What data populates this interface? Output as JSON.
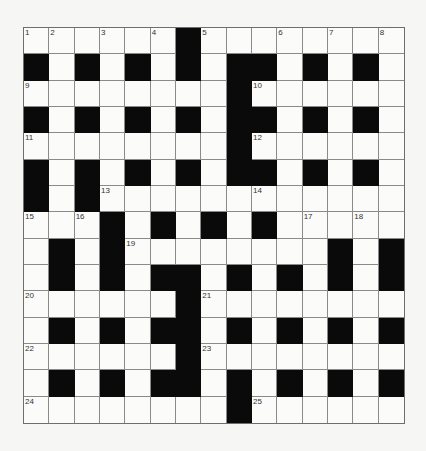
{
  "puzzle": {
    "rows": 15,
    "cols": 15,
    "colors": {
      "block": "#0a0a0a",
      "cell": "#fbfbfa",
      "gridline": "#8a8a8a",
      "background": "#f6f6f4"
    },
    "layout": [
      "......#........",
      "#.#.#.#.##.#.#.",
      "........#......",
      "#.#.#.#.##.#.#.",
      "........#......",
      "#.#.#.#.##.#.#.",
      "#.#............",
      "...#.#.#.#.....",
      ".#.#........#.#",
      ".#.#.##.#.#.#.#",
      "......#........",
      ".#.#.##.#.#.#.#",
      "......#........",
      ".#.#.##.#.#.#.#",
      "........#......"
    ],
    "numbers": [
      {
        "row": 0,
        "col": 0,
        "n": "1"
      },
      {
        "row": 0,
        "col": 1,
        "n": "2"
      },
      {
        "row": 0,
        "col": 3,
        "n": "3"
      },
      {
        "row": 0,
        "col": 5,
        "n": "4"
      },
      {
        "row": 0,
        "col": 7,
        "n": "5"
      },
      {
        "row": 0,
        "col": 10,
        "n": "6"
      },
      {
        "row": 0,
        "col": 12,
        "n": "7"
      },
      {
        "row": 0,
        "col": 14,
        "n": "8"
      },
      {
        "row": 2,
        "col": 0,
        "n": "9"
      },
      {
        "row": 2,
        "col": 9,
        "n": "10"
      },
      {
        "row": 4,
        "col": 0,
        "n": "11"
      },
      {
        "row": 4,
        "col": 9,
        "n": "12"
      },
      {
        "row": 6,
        "col": 3,
        "n": "13"
      },
      {
        "row": 6,
        "col": 9,
        "n": "14"
      },
      {
        "row": 7,
        "col": 0,
        "n": "15"
      },
      {
        "row": 7,
        "col": 2,
        "n": "16"
      },
      {
        "row": 7,
        "col": 11,
        "n": "17"
      },
      {
        "row": 7,
        "col": 13,
        "n": "18"
      },
      {
        "row": 8,
        "col": 4,
        "n": "19"
      },
      {
        "row": 10,
        "col": 0,
        "n": "20"
      },
      {
        "row": 10,
        "col": 7,
        "n": "21"
      },
      {
        "row": 12,
        "col": 0,
        "n": "22"
      },
      {
        "row": 12,
        "col": 7,
        "n": "23"
      },
      {
        "row": 14,
        "col": 0,
        "n": "24"
      },
      {
        "row": 14,
        "col": 9,
        "n": "25"
      }
    ]
  }
}
